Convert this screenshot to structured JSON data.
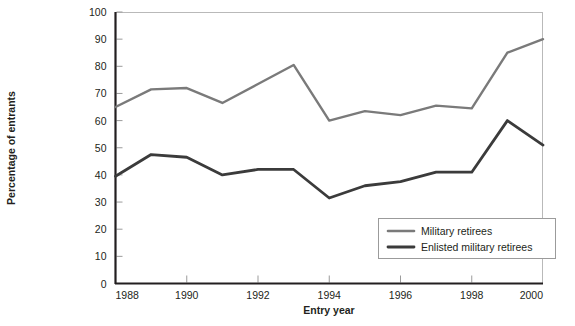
{
  "chart_data": {
    "type": "line",
    "title": "",
    "xlabel": "Entry year",
    "ylabel": "Percentage of entrants",
    "x": [
      1988,
      1989,
      1990,
      1991,
      1992,
      1993,
      1994,
      1995,
      1996,
      1997,
      1998,
      1999,
      2000
    ],
    "xlim": [
      1988,
      2000
    ],
    "ylim": [
      0,
      100
    ],
    "xticks": [
      1988,
      1990,
      1992,
      1994,
      1996,
      1998,
      2000
    ],
    "xtick_labels": [
      "1988",
      "1990",
      "1992",
      "1994",
      "1996",
      "1998",
      "2000"
    ],
    "yticks": [
      0,
      10,
      20,
      30,
      40,
      50,
      60,
      70,
      80,
      90,
      100
    ],
    "ytick_labels": [
      "0",
      "10",
      "20",
      "30",
      "40",
      "50",
      "60",
      "70",
      "80",
      "90",
      "100"
    ],
    "grid": false,
    "legend_position": "lower-right",
    "series": [
      {
        "name": "Military retirees",
        "color": "#7a7a7a",
        "values": [
          65,
          71.5,
          72,
          66.5,
          73.5,
          80.5,
          60,
          63.5,
          62,
          65.5,
          64.5,
          85,
          90
        ]
      },
      {
        "name": "Enlisted military retirees",
        "color": "#3b3b3b",
        "values": [
          39.5,
          47.5,
          46.5,
          40,
          42,
          42,
          31.5,
          36,
          37.5,
          41,
          41,
          60,
          51
        ]
      }
    ]
  },
  "legend": {
    "items": [
      {
        "label": "Military retirees"
      },
      {
        "label": "Enlisted military retirees"
      }
    ]
  },
  "colors": {
    "series_light": "#7a7a7a",
    "series_dark": "#3b3b3b",
    "axis": "#231f20",
    "frame": "#b9b9b9",
    "background": "#ffffff"
  }
}
